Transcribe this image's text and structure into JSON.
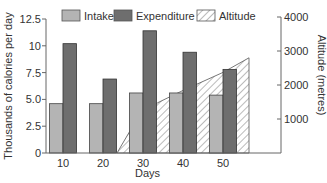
{
  "chart_data": {
    "type": "bar",
    "title": "",
    "categories": [
      "10",
      "20",
      "30",
      "40",
      "50"
    ],
    "xlabel": "Days",
    "ylabel": "Thousands of calories per day",
    "ylabel_right": "Altitude (metres)",
    "ylim": [
      0,
      12.5
    ],
    "ylim_right": [
      0,
      4000
    ],
    "yticks": [
      "0",
      "2.5",
      "5.0",
      "7.5",
      "10",
      "12.5"
    ],
    "yticks_right": [
      "1000",
      "2000",
      "3000",
      "4000"
    ],
    "grid": false,
    "legend_position": "top",
    "series": [
      {
        "name": "Intake",
        "type": "bar",
        "axis": "left",
        "color": "#b4b4b4",
        "values": [
          4.6,
          4.6,
          5.6,
          5.6,
          5.4
        ]
      },
      {
        "name": "Expenditure",
        "type": "bar",
        "axis": "left",
        "color": "#6e6e6e",
        "values": [
          10.2,
          6.9,
          11.4,
          9.4,
          7.8
        ]
      },
      {
        "name": "Altitude",
        "type": "area",
        "axis": "right",
        "pattern": "hatched",
        "x": [
          23.5,
          27,
          30,
          33.7,
          40,
          50,
          56.5
        ],
        "values": [
          0,
          700,
          1100,
          1480,
          1840,
          2370,
          2800
        ]
      }
    ]
  },
  "legend": [
    {
      "label": "Intake"
    },
    {
      "label": "Expenditure"
    },
    {
      "label": "Altitude"
    }
  ],
  "axes": {
    "x_title": "Days",
    "y_left_title": "Thousands of calories per day",
    "y_right_title": "Altitude (metres)"
  }
}
